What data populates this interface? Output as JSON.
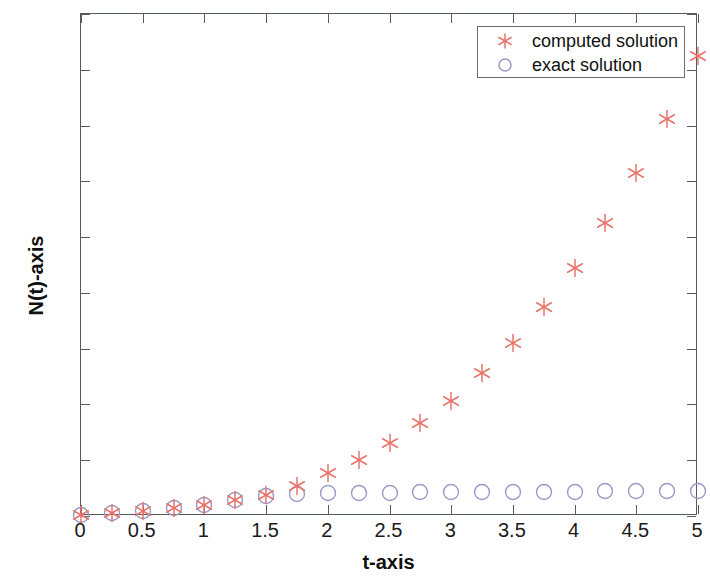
{
  "chart_data": {
    "type": "scatter",
    "title": "",
    "xlabel": "t-axis",
    "ylabel": "N(t)-axis",
    "xlim": [
      0,
      5
    ],
    "ylim": [
      0,
      4500
    ],
    "xticks": [
      "0",
      "0.5",
      "1",
      "1.5",
      "2",
      "2.5",
      "3",
      "3.5",
      "4",
      "4.5",
      "5"
    ],
    "xtick_values": [
      0,
      0.5,
      1,
      1.5,
      2,
      2.5,
      3,
      3.5,
      4,
      4.5,
      5
    ],
    "yticks": [
      "0",
      "500",
      "1000",
      "1500",
      "2000",
      "2500",
      "3000",
      "3500",
      "4000",
      "4500"
    ],
    "ytick_values": [
      0,
      500,
      1000,
      1500,
      2000,
      2500,
      3000,
      3500,
      4000,
      4500
    ],
    "grid": false,
    "legend_position": "upper right",
    "x": [
      0,
      0.25,
      0.5,
      0.75,
      1,
      1.25,
      1.5,
      1.75,
      2,
      2.25,
      2.5,
      2.75,
      3,
      3.25,
      3.5,
      3.75,
      4,
      4.25,
      4.5,
      4.75,
      5
    ],
    "series": [
      {
        "name": "computed solution",
        "marker": "asterisk",
        "color": "#e8736a",
        "values": [
          10,
          25,
          42,
          68,
          100,
          140,
          185,
          270,
          385,
          505,
          655,
          830,
          1035,
          1280,
          1550,
          1870,
          2225,
          2625,
          3075,
          3560,
          4120
        ]
      },
      {
        "name": "exact solution",
        "marker": "circle",
        "color": "#9a9ac8",
        "values": [
          10,
          25,
          42,
          68,
          100,
          140,
          180,
          200,
          205,
          208,
          210,
          212,
          214,
          215,
          216,
          218,
          219,
          220,
          222,
          223,
          225
        ]
      }
    ]
  },
  "legend": {
    "entries": [
      {
        "label": "computed solution",
        "symbol": "asterisk-marker",
        "color": "#e8736a"
      },
      {
        "label": "exact solution",
        "symbol": "circle-marker",
        "color": "#9a9ac8"
      }
    ]
  },
  "axes": {
    "x_title": "t-axis",
    "y_title": "N(t)-axis"
  }
}
